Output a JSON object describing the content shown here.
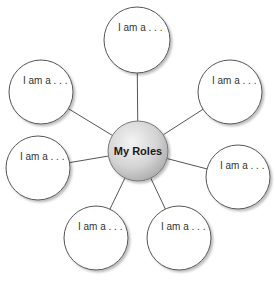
{
  "diagram": {
    "type": "web-organizer",
    "center": {
      "label": "My Roles",
      "cx": 138,
      "cy": 151,
      "r": 30
    },
    "nodes": [
      {
        "label": "I am a . . .",
        "cx": 137,
        "cy": 40,
        "r": 33
      },
      {
        "label": "I am a . . .",
        "cx": 41,
        "cy": 92,
        "r": 32
      },
      {
        "label": "I am a . . .",
        "cx": 230,
        "cy": 92,
        "r": 32
      },
      {
        "label": "I am a . . .",
        "cx": 38,
        "cy": 168,
        "r": 32
      },
      {
        "label": "I am a . . .",
        "cx": 238,
        "cy": 177,
        "r": 32
      },
      {
        "label": "I am a . . .",
        "cx": 96,
        "cy": 238,
        "r": 32
      },
      {
        "label": "I am a . . .",
        "cx": 179,
        "cy": 238,
        "r": 32
      }
    ],
    "colors": {
      "stroke": "#555555",
      "node_fill": "#ffffff",
      "center_fill_light": "#f2f2f2",
      "center_fill_dark": "#b5b5b5",
      "shadow": "#cfcfcf"
    }
  }
}
